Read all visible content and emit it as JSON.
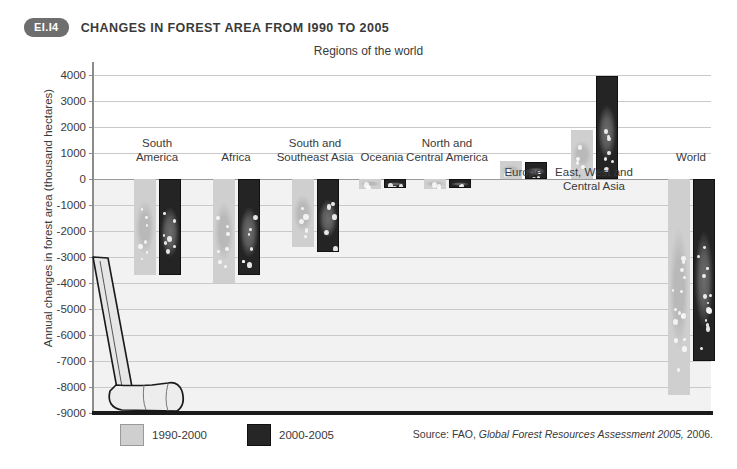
{
  "header": {
    "badge": "EI.I4",
    "title": "CHANGES IN FOREST AREA FROM I990 TO 2005"
  },
  "source": {
    "prefix": "Source: FAO,",
    "italic": "Global Forest Resources Assessment 2005,",
    "suffix": "2006."
  },
  "legend": {
    "items": [
      {
        "label": "1990-2000",
        "color": "#cfcfcf"
      },
      {
        "label": "2000-2005",
        "color": "#262626"
      }
    ]
  },
  "colors": {
    "series_light": "#cfcfcf",
    "series_dark": "#262626",
    "plot_background": "#f2f2f2",
    "gridline": "#c9c9c9",
    "axis": "#1a1a1a",
    "badge": "#6e6e6e"
  },
  "chart_data": {
    "type": "bar",
    "title": "CHANGES IN FOREST AREA FROM I990 TO 2005",
    "xlabel": "Regions of the world",
    "ylabel": "Annual changes in forest area (thousand hectares)",
    "ylim": [
      -9000,
      4500
    ],
    "yticks": [
      4000,
      3000,
      2000,
      1000,
      0,
      -1000,
      -2000,
      -3000,
      -4000,
      -5000,
      -6000,
      -7000,
      -8000,
      -9000
    ],
    "ytick_labels": [
      "4000",
      "3000",
      "2000",
      "1000",
      "0",
      "-1000",
      "-2000",
      "-3000",
      "-4000",
      "-5000",
      "-6000",
      "-7000",
      "-8000",
      "-9000"
    ],
    "grid": true,
    "legend_position": "bottom-left",
    "categories": [
      "South America",
      "Africa",
      "South and Southeast Asia",
      "Oceania",
      "North and Central America",
      "Europe",
      "East, West and Central Asia",
      "World"
    ],
    "category_labels": [
      [
        "South",
        "America"
      ],
      [
        "Africa"
      ],
      [
        "South and",
        "Southeast Asia"
      ],
      [
        "Oceania"
      ],
      [
        "North and",
        "Central America"
      ],
      [
        "Europe"
      ],
      [
        "East, West and",
        "Central Asia"
      ],
      [
        "World"
      ]
    ],
    "series": [
      {
        "name": "1990-2000",
        "values": [
          -3700,
          -4000,
          -2600,
          -370,
          -370,
          700,
          1900,
          -8300
        ]
      },
      {
        "name": "2000-2005",
        "values": [
          -3700,
          -3700,
          -2800,
          -360,
          -330,
          650,
          3980,
          -7000
        ]
      }
    ]
  }
}
